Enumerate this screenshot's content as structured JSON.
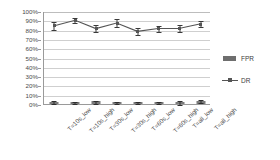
{
  "chart_data": {
    "type": "bar",
    "title": "",
    "xlabel": "",
    "ylabel": "",
    "ylim": [
      0,
      100
    ],
    "yticks": [
      "0%",
      "10%",
      "20%",
      "30%",
      "40%",
      "50%",
      "60%",
      "70%",
      "80%",
      "90%",
      "100%"
    ],
    "ytick_values": [
      0,
      10,
      20,
      30,
      40,
      50,
      60,
      70,
      80,
      90,
      100
    ],
    "grid": true,
    "legend_position": "right",
    "categories": [
      "T=10s_low",
      "T=10s_high",
      "T=30s_low",
      "T=30s_high",
      "T=60s_low",
      "T=60s_high",
      "T=all_low",
      "T=all_high"
    ],
    "series": [
      {
        "name": "FPR",
        "type": "bar",
        "color": "#7b7b7b",
        "values": [
          2.5,
          2.0,
          3.0,
          2.0,
          2.0,
          2.5,
          2.5,
          3.5
        ],
        "errors": [
          1.5,
          1.0,
          1.5,
          1.0,
          1.2,
          1.2,
          2.0,
          1.5
        ]
      },
      {
        "name": "DR",
        "type": "line",
        "color": "#555555",
        "values": [
          85,
          91,
          82,
          88,
          79,
          82,
          82,
          87
        ],
        "errors": [
          4,
          3,
          4,
          4,
          4,
          3,
          4,
          3
        ]
      }
    ]
  },
  "legend": {
    "items": [
      {
        "label": "FPR",
        "key": "bar-swatch"
      },
      {
        "label": "DR",
        "key": "line-marker"
      }
    ]
  }
}
